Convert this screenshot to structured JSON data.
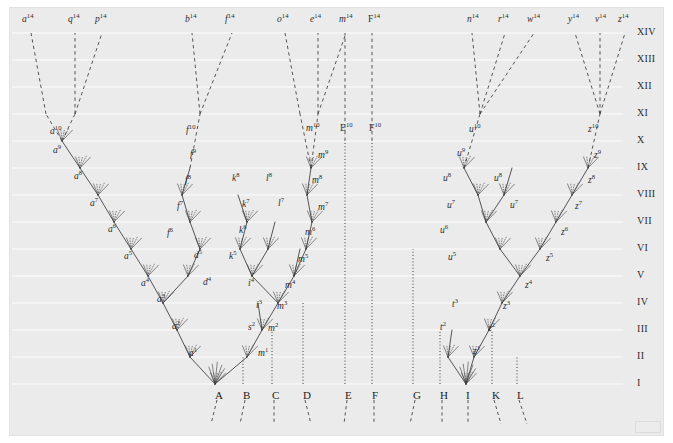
{
  "figure": {
    "background_color": "#ebebeb",
    "ink_color": "#3a3a3a",
    "gridline_color": "#f7f7f7"
  },
  "geometry": {
    "plate": {
      "x": 10,
      "y": 8,
      "w": 653,
      "h": 427
    },
    "row_tops": [
      33,
      60,
      87,
      114,
      141,
      168,
      195,
      222,
      249,
      276,
      303,
      330,
      357,
      384
    ],
    "baseline_y": 384,
    "top_label_y": 22,
    "bottom_label_y": 390
  },
  "axis": {
    "roman_x": 637,
    "levels": [
      {
        "label": "XIV",
        "y": 33
      },
      {
        "label": "XIII",
        "y": 60
      },
      {
        "label": "XII",
        "y": 87
      },
      {
        "label": "XI",
        "y": 114
      },
      {
        "label": "X",
        "y": 141
      },
      {
        "label": "IX",
        "y": 168
      },
      {
        "label": "VIII",
        "y": 195
      },
      {
        "label": "VII",
        "y": 222
      },
      {
        "label": "VI",
        "y": 249
      },
      {
        "label": "V",
        "y": 276
      },
      {
        "label": "IV",
        "y": 303
      },
      {
        "label": "III",
        "y": 330
      },
      {
        "label": "II",
        "y": 357
      },
      {
        "label": "I",
        "y": 384
      }
    ]
  },
  "base_labels": [
    {
      "letter": "A",
      "x": 215
    },
    {
      "letter": "B",
      "x": 243
    },
    {
      "letter": "C",
      "x": 272
    },
    {
      "letter": "D",
      "x": 303
    },
    {
      "letter": "E",
      "x": 345
    },
    {
      "letter": "F",
      "x": 372
    },
    {
      "letter": "G",
      "x": 413
    },
    {
      "letter": "H",
      "x": 440
    },
    {
      "letter": "I",
      "x": 466
    },
    {
      "letter": "K",
      "x": 492
    },
    {
      "letter": "L",
      "x": 517
    }
  ],
  "top_labels": [
    {
      "name": "a",
      "sup": "14",
      "x": 22,
      "y": 22
    },
    {
      "name": "q",
      "sup": "14",
      "x": 68,
      "y": 22
    },
    {
      "name": "p",
      "sup": "14",
      "x": 95,
      "y": 22
    },
    {
      "name": "b",
      "sup": "14",
      "x": 185,
      "y": 22
    },
    {
      "name": "f",
      "sup": "14",
      "x": 225,
      "y": 22
    },
    {
      "name": "o",
      "sup": "14",
      "x": 277,
      "y": 22
    },
    {
      "name": "e",
      "sup": "14",
      "x": 310,
      "y": 22
    },
    {
      "name": "m",
      "sup": "14",
      "x": 339,
      "y": 22
    },
    {
      "name": "F",
      "sup": "14",
      "x": 368,
      "y": 22,
      "upright": true
    },
    {
      "name": "n",
      "sup": "14",
      "x": 467,
      "y": 22
    },
    {
      "name": "r",
      "sup": "14",
      "x": 498,
      "y": 22
    },
    {
      "name": "w",
      "sup": "14",
      "x": 527,
      "y": 22
    },
    {
      "name": "y",
      "sup": "14",
      "x": 568,
      "y": 22
    },
    {
      "name": "v",
      "sup": "14",
      "x": 595,
      "y": 22
    },
    {
      "name": "z",
      "sup": "14",
      "x": 618,
      "y": 22
    }
  ],
  "level_x_labels": [
    {
      "name": "a",
      "sup": "10",
      "x": 50,
      "y": 134
    },
    {
      "name": "f",
      "sup": "10",
      "x": 186,
      "y": 133
    },
    {
      "name": "m",
      "sup": "10",
      "x": 306,
      "y": 131
    },
    {
      "name": "E",
      "sup": "10",
      "x": 340,
      "y": 131,
      "upright": true
    },
    {
      "name": "F",
      "sup": "10",
      "x": 369,
      "y": 131,
      "upright": true
    },
    {
      "name": "u",
      "sup": "10",
      "x": 469,
      "y": 132
    },
    {
      "name": "z",
      "sup": "10",
      "x": 588,
      "y": 132
    }
  ],
  "lineage_labels": [
    {
      "name": "a",
      "sup": "9",
      "x": 53,
      "y": 152
    },
    {
      "name": "a",
      "sup": "8",
      "x": 74,
      "y": 178
    },
    {
      "name": "a",
      "sup": "7",
      "x": 90,
      "y": 205
    },
    {
      "name": "a",
      "sup": "6",
      "x": 108,
      "y": 231
    },
    {
      "name": "a",
      "sup": "5",
      "x": 124,
      "y": 258
    },
    {
      "name": "a",
      "sup": "4",
      "x": 141,
      "y": 285
    },
    {
      "name": "a",
      "sup": "3",
      "x": 157,
      "y": 301
    },
    {
      "name": "a",
      "sup": "2",
      "x": 172,
      "y": 328
    },
    {
      "name": "a",
      "sup": "1",
      "x": 189,
      "y": 355
    },
    {
      "name": "f",
      "sup": "9",
      "x": 190,
      "y": 156
    },
    {
      "name": "f",
      "sup": "8",
      "x": 185,
      "y": 182
    },
    {
      "name": "f",
      "sup": "7",
      "x": 177,
      "y": 208
    },
    {
      "name": "f",
      "sup": "6",
      "x": 167,
      "y": 235
    },
    {
      "name": "d",
      "sup": "5",
      "x": 194,
      "y": 257
    },
    {
      "name": "d",
      "sup": "4",
      "x": 203,
      "y": 284
    },
    {
      "name": "k",
      "sup": "8",
      "x": 232,
      "y": 180
    },
    {
      "name": "k",
      "sup": "7",
      "x": 242,
      "y": 206
    },
    {
      "name": "k",
      "sup": "6",
      "x": 239,
      "y": 232
    },
    {
      "name": "k",
      "sup": "5",
      "x": 229,
      "y": 258
    },
    {
      "name": "l",
      "sup": "8",
      "x": 266,
      "y": 180
    },
    {
      "name": "l",
      "sup": "7",
      "x": 278,
      "y": 205
    },
    {
      "name": "i",
      "sup": "4",
      "x": 248,
      "y": 285
    },
    {
      "name": "i",
      "sup": "3",
      "x": 256,
      "y": 307
    },
    {
      "name": "s",
      "sup": "2",
      "x": 248,
      "y": 329
    },
    {
      "name": "m",
      "sup": "9",
      "x": 318,
      "y": 157
    },
    {
      "name": "m",
      "sup": "8",
      "x": 312,
      "y": 182
    },
    {
      "name": "m",
      "sup": "7",
      "x": 318,
      "y": 209
    },
    {
      "name": "m",
      "sup": "6",
      "x": 305,
      "y": 234
    },
    {
      "name": "m",
      "sup": "5",
      "x": 298,
      "y": 261
    },
    {
      "name": "m",
      "sup": "4",
      "x": 285,
      "y": 287
    },
    {
      "name": "m",
      "sup": "3",
      "x": 277,
      "y": 308
    },
    {
      "name": "m",
      "sup": "2",
      "x": 268,
      "y": 330
    },
    {
      "name": "m",
      "sup": "1",
      "x": 258,
      "y": 355
    },
    {
      "name": "u",
      "sup": "9",
      "x": 457,
      "y": 155
    },
    {
      "name": "u",
      "sup": "8",
      "x": 443,
      "y": 180
    },
    {
      "name": "u",
      "sup": "7",
      "x": 447,
      "y": 207
    },
    {
      "name": "u",
      "sup": "6",
      "x": 440,
      "y": 232
    },
    {
      "name": "u",
      "sup": "5",
      "x": 448,
      "y": 259
    },
    {
      "name": "u",
      "sup": "8",
      "x": 494,
      "y": 180
    },
    {
      "name": "u",
      "sup": "7",
      "x": 510,
      "y": 207
    },
    {
      "name": "z",
      "sup": "9",
      "x": 594,
      "y": 157
    },
    {
      "name": "z",
      "sup": "8",
      "x": 588,
      "y": 182
    },
    {
      "name": "z",
      "sup": "7",
      "x": 575,
      "y": 208
    },
    {
      "name": "z",
      "sup": "6",
      "x": 561,
      "y": 234
    },
    {
      "name": "z",
      "sup": "5",
      "x": 546,
      "y": 260
    },
    {
      "name": "z",
      "sup": "4",
      "x": 525,
      "y": 287
    },
    {
      "name": "z",
      "sup": "3",
      "x": 503,
      "y": 308
    },
    {
      "name": "z",
      "sup": "2",
      "x": 488,
      "y": 330
    },
    {
      "name": "z",
      "sup": "1",
      "x": 473,
      "y": 353
    },
    {
      "name": "t",
      "sup": "3",
      "x": 452,
      "y": 306
    },
    {
      "name": "t",
      "sup": "2",
      "x": 440,
      "y": 329
    }
  ],
  "tree": {
    "description": "Branching lineages rising from the baseline taxa A..L through levels I..XIV",
    "solid_branches": [
      [
        215,
        384,
        190,
        357
      ],
      [
        190,
        357,
        177,
        330
      ],
      [
        177,
        330,
        163,
        303
      ],
      [
        163,
        303,
        148,
        276
      ],
      [
        148,
        276,
        131,
        249
      ],
      [
        131,
        249,
        114,
        222
      ],
      [
        114,
        222,
        98,
        195
      ],
      [
        98,
        195,
        80,
        168
      ],
      [
        80,
        168,
        62,
        141
      ],
      [
        163,
        303,
        188,
        276
      ],
      [
        188,
        276,
        200,
        249
      ],
      [
        215,
        384,
        247,
        357
      ],
      [
        247,
        357,
        262,
        330
      ],
      [
        262,
        330,
        278,
        303
      ],
      [
        278,
        303,
        294,
        276
      ],
      [
        294,
        276,
        306,
        249
      ],
      [
        306,
        249,
        312,
        222
      ],
      [
        312,
        222,
        307,
        195
      ],
      [
        307,
        195,
        311,
        168
      ],
      [
        278,
        303,
        252,
        276
      ],
      [
        252,
        276,
        240,
        249
      ],
      [
        240,
        249,
        247,
        222
      ],
      [
        247,
        222,
        238,
        195
      ],
      [
        252,
        276,
        268,
        249
      ],
      [
        268,
        249,
        275,
        222
      ],
      [
        262,
        330,
        258,
        303
      ],
      [
        294,
        276,
        300,
        249
      ],
      [
        200,
        249,
        190,
        222
      ],
      [
        190,
        222,
        182,
        195
      ],
      [
        182,
        195,
        190,
        168
      ],
      [
        466,
        384,
        474,
        357
      ],
      [
        474,
        357,
        489,
        330
      ],
      [
        489,
        330,
        502,
        303
      ],
      [
        502,
        303,
        520,
        276
      ],
      [
        520,
        276,
        540,
        249
      ],
      [
        540,
        249,
        556,
        222
      ],
      [
        556,
        222,
        572,
        195
      ],
      [
        572,
        195,
        588,
        168
      ],
      [
        466,
        384,
        448,
        357
      ],
      [
        448,
        357,
        452,
        330
      ],
      [
        520,
        276,
        500,
        249
      ],
      [
        500,
        249,
        486,
        222
      ],
      [
        486,
        222,
        478,
        195
      ],
      [
        478,
        195,
        464,
        168
      ],
      [
        486,
        222,
        504,
        195
      ],
      [
        504,
        195,
        512,
        168
      ]
    ],
    "dotted_columns": [
      {
        "label": "B",
        "x": 243,
        "from_y": 384,
        "to_y": 357
      },
      {
        "label": "C",
        "x": 272,
        "from_y": 384,
        "to_y": 330
      },
      {
        "label": "D",
        "x": 303,
        "from_y": 384,
        "to_y": 303
      },
      {
        "label": "E",
        "x": 345,
        "from_y": 384,
        "to_y": 141
      },
      {
        "label": "F",
        "x": 372,
        "from_y": 384,
        "to_y": 141
      },
      {
        "label": "G",
        "x": 413,
        "from_y": 384,
        "to_y": 249
      },
      {
        "label": "H",
        "x": 440,
        "from_y": 384,
        "to_y": 330
      },
      {
        "label": "K",
        "x": 492,
        "from_y": 384,
        "to_y": 330
      },
      {
        "label": "L",
        "x": 517,
        "from_y": 384,
        "to_y": 357
      }
    ],
    "dashed_top_branches": [
      [
        62,
        141,
        46,
        114
      ],
      [
        46,
        114,
        31,
        33
      ],
      [
        62,
        141,
        75,
        114
      ],
      [
        75,
        114,
        75,
        33
      ],
      [
        75,
        114,
        102,
        33
      ],
      [
        190,
        168,
        200,
        114
      ],
      [
        200,
        114,
        192,
        33
      ],
      [
        200,
        114,
        232,
        33
      ],
      [
        311,
        168,
        300,
        114
      ],
      [
        300,
        114,
        285,
        33
      ],
      [
        311,
        168,
        318,
        114
      ],
      [
        318,
        114,
        318,
        33
      ],
      [
        318,
        114,
        346,
        33
      ],
      [
        345,
        141,
        345,
        33
      ],
      [
        372,
        141,
        372,
        33
      ],
      [
        464,
        168,
        480,
        114
      ],
      [
        480,
        114,
        472,
        33
      ],
      [
        480,
        114,
        505,
        33
      ],
      [
        480,
        114,
        534,
        33
      ],
      [
        588,
        168,
        600,
        114
      ],
      [
        600,
        114,
        575,
        33
      ],
      [
        600,
        114,
        600,
        33
      ],
      [
        600,
        114,
        625,
        33
      ]
    ]
  }
}
